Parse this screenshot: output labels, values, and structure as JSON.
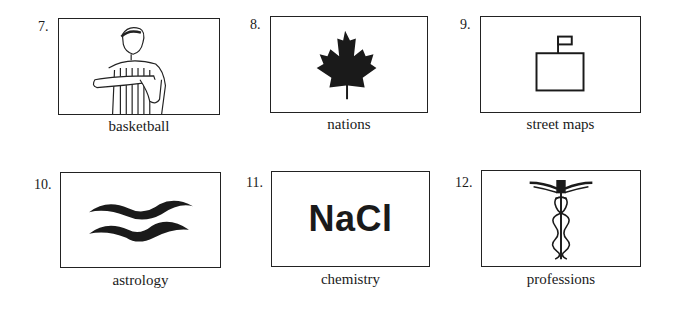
{
  "items": [
    {
      "number": "7.",
      "label": "basketball",
      "icon": "referee-timeout-icon"
    },
    {
      "number": "8.",
      "label": "nations",
      "icon": "maple-leaf-icon"
    },
    {
      "number": "9.",
      "label": "street maps",
      "icon": "building-flag-icon"
    },
    {
      "number": "10.",
      "label": "astrology",
      "icon": "aquarius-icon",
      "text": ""
    },
    {
      "number": "11.",
      "label": "chemistry",
      "icon": "nacl-text-icon",
      "text": "NaCl"
    },
    {
      "number": "12.",
      "label": "professions",
      "icon": "caduceus-icon"
    }
  ]
}
